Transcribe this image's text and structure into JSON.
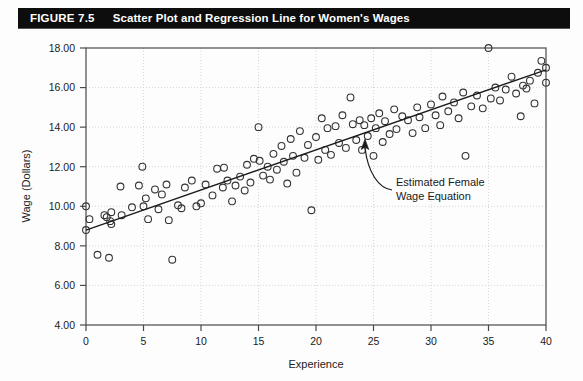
{
  "figure": {
    "number_label": "FIGURE 7.5",
    "title": "Scatter Plot and Regression Line for Women's Wages",
    "title_bar_color": "#0d0d0d",
    "title_text_color": "#ffffff",
    "background_color": "#fdfdfd"
  },
  "annotation": {
    "line1": "Estimated Female",
    "line2": "Wage Equation"
  },
  "chart_data": {
    "type": "scatter",
    "title": "Scatter Plot and Regression Line for Women's Wages",
    "xlabel": "Experience",
    "ylabel": "Wage (Dollars)",
    "xlim": [
      0,
      40
    ],
    "ylim": [
      4.0,
      18.0
    ],
    "xticks": [
      0,
      5,
      10,
      15,
      20,
      25,
      30,
      35,
      40
    ],
    "xtick_labels": [
      "0",
      "5",
      "10",
      "15",
      "20",
      "25",
      "30",
      "35",
      "40"
    ],
    "yticks": [
      4.0,
      6.0,
      8.0,
      10.0,
      12.0,
      14.0,
      16.0,
      18.0
    ],
    "ytick_labels": [
      "4.00",
      "6.00",
      "8.00",
      "10.00",
      "12.00",
      "14.00",
      "16.00",
      "18.00"
    ],
    "grid": true,
    "grid_style": "dotted",
    "grid_color": "#cccccc",
    "legend": null,
    "marker": "open-circle",
    "marker_color": "#333333",
    "marker_radius": 3.4,
    "series": [
      {
        "name": "Women's wages",
        "points": [
          [
            0.0,
            10.0
          ],
          [
            0.0,
            8.8
          ],
          [
            0.3,
            9.35
          ],
          [
            1.0,
            7.55
          ],
          [
            1.6,
            9.55
          ],
          [
            1.8,
            9.45
          ],
          [
            2.0,
            7.4
          ],
          [
            2.1,
            9.25
          ],
          [
            2.2,
            9.1
          ],
          [
            2.2,
            9.7
          ],
          [
            3.0,
            11.0
          ],
          [
            3.1,
            9.55
          ],
          [
            4.0,
            9.95
          ],
          [
            4.6,
            11.05
          ],
          [
            4.9,
            12.0
          ],
          [
            5.0,
            10.0
          ],
          [
            5.2,
            10.4
          ],
          [
            5.4,
            9.35
          ],
          [
            6.0,
            10.85
          ],
          [
            6.3,
            9.85
          ],
          [
            6.6,
            10.6
          ],
          [
            7.0,
            11.1
          ],
          [
            7.2,
            9.3
          ],
          [
            7.5,
            7.3
          ],
          [
            8.0,
            10.05
          ],
          [
            8.3,
            9.9
          ],
          [
            8.6,
            10.95
          ],
          [
            9.2,
            11.3
          ],
          [
            9.6,
            10.0
          ],
          [
            10.0,
            10.15
          ],
          [
            10.4,
            11.1
          ],
          [
            11.0,
            10.55
          ],
          [
            11.4,
            11.9
          ],
          [
            11.9,
            10.95
          ],
          [
            12.0,
            11.95
          ],
          [
            12.3,
            11.3
          ],
          [
            12.7,
            10.25
          ],
          [
            13.0,
            11.05
          ],
          [
            13.4,
            11.5
          ],
          [
            13.8,
            10.8
          ],
          [
            14.0,
            12.1
          ],
          [
            14.3,
            11.2
          ],
          [
            14.6,
            12.4
          ],
          [
            15.0,
            14.0
          ],
          [
            15.1,
            12.3
          ],
          [
            15.4,
            11.55
          ],
          [
            15.8,
            12.0
          ],
          [
            16.0,
            11.35
          ],
          [
            16.3,
            12.65
          ],
          [
            16.6,
            11.85
          ],
          [
            17.0,
            13.05
          ],
          [
            17.2,
            12.25
          ],
          [
            17.5,
            11.15
          ],
          [
            17.8,
            13.4
          ],
          [
            18.0,
            12.55
          ],
          [
            18.3,
            11.7
          ],
          [
            18.6,
            13.8
          ],
          [
            19.0,
            12.45
          ],
          [
            19.3,
            13.1
          ],
          [
            19.6,
            9.8
          ],
          [
            20.0,
            13.5
          ],
          [
            20.2,
            12.35
          ],
          [
            20.5,
            14.45
          ],
          [
            20.8,
            12.85
          ],
          [
            21.0,
            13.95
          ],
          [
            21.3,
            12.6
          ],
          [
            21.7,
            14.05
          ],
          [
            22.0,
            13.2
          ],
          [
            22.3,
            14.6
          ],
          [
            22.6,
            12.95
          ],
          [
            23.0,
            15.5
          ],
          [
            23.2,
            14.15
          ],
          [
            23.5,
            13.35
          ],
          [
            23.8,
            14.35
          ],
          [
            24.0,
            12.85
          ],
          [
            24.2,
            14.1
          ],
          [
            24.5,
            13.55
          ],
          [
            24.8,
            14.45
          ],
          [
            25.0,
            12.55
          ],
          [
            25.2,
            13.95
          ],
          [
            25.5,
            14.7
          ],
          [
            25.8,
            13.25
          ],
          [
            26.0,
            14.3
          ],
          [
            26.4,
            13.65
          ],
          [
            26.8,
            14.9
          ],
          [
            27.0,
            13.9
          ],
          [
            27.5,
            14.55
          ],
          [
            28.0,
            14.35
          ],
          [
            28.4,
            13.7
          ],
          [
            28.8,
            15.0
          ],
          [
            29.0,
            14.5
          ],
          [
            29.5,
            13.95
          ],
          [
            30.0,
            15.15
          ],
          [
            30.4,
            14.6
          ],
          [
            30.8,
            14.1
          ],
          [
            31.0,
            15.55
          ],
          [
            31.5,
            14.8
          ],
          [
            32.0,
            15.25
          ],
          [
            32.4,
            14.45
          ],
          [
            32.8,
            15.75
          ],
          [
            33.0,
            12.55
          ],
          [
            33.5,
            15.05
          ],
          [
            34.0,
            15.6
          ],
          [
            34.5,
            14.95
          ],
          [
            35.0,
            18.0
          ],
          [
            35.2,
            15.45
          ],
          [
            35.6,
            16.0
          ],
          [
            36.0,
            15.35
          ],
          [
            36.5,
            15.9
          ],
          [
            37.0,
            16.55
          ],
          [
            37.4,
            15.7
          ],
          [
            37.8,
            14.55
          ],
          [
            38.0,
            16.1
          ],
          [
            38.3,
            15.95
          ],
          [
            38.6,
            16.35
          ],
          [
            39.0,
            15.2
          ],
          [
            39.3,
            16.75
          ],
          [
            39.6,
            17.35
          ],
          [
            40.0,
            16.25
          ],
          [
            40.0,
            17.0
          ]
        ]
      }
    ],
    "regression_line": {
      "name": "Estimated Female Wage Equation",
      "x_start": 0.0,
      "y_start": 8.8,
      "x_end": 40.0,
      "y_end": 16.9,
      "color": "#1a1a1a"
    }
  }
}
